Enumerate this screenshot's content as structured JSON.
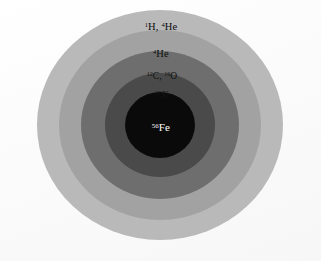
{
  "figure": {
    "background_color": "#fdfdfd",
    "center_x": 160,
    "center_y": 125
  },
  "chart_data": {
    "type": "pie",
    "subtitle": "",
    "xlabel": "",
    "ylabel": "",
    "legend_position": "none",
    "grid": false,
    "note": "Concentric nested shells of a pre-supernova massive star; each ring is labelled with its dominant nuclear species. Radii are in screenshot pixels measured from the common centre.",
    "categories": [
      "1H, 4He",
      "4He",
      "12C, 16O",
      "28Si",
      "56Fe"
    ],
    "values": [
      123,
      101,
      79,
      55,
      35
    ],
    "ylim": [
      0,
      123
    ],
    "shells": [
      {
        "index": 0,
        "label_html": "<sup>1</sup>H, <sup>4</sup>He",
        "label_plain": "1H, 4He",
        "nuclides": [
          "1H",
          "4He"
        ],
        "radius_x": 123,
        "radius_y": 115,
        "color": "#b9b9b9",
        "text_color": "#0d0d0d",
        "font_size_px": 10.5,
        "label_x": 161,
        "label_y": 27
      },
      {
        "index": 1,
        "label_html": "<sup>4</sup>He",
        "label_plain": "4He",
        "nuclides": [
          "4He"
        ],
        "radius_x": 101,
        "radius_y": 95,
        "color": "#a2a2a2",
        "text_color": "#0d0d0d",
        "font_size_px": 10.5,
        "label_x": 161,
        "label_y": 54
      },
      {
        "index": 2,
        "label_html": "<sup>12</sup>C, <sup>16</sup>O",
        "label_plain": "12C, 16O",
        "nuclides": [
          "12C",
          "16O"
        ],
        "radius_x": 79,
        "radius_y": 74,
        "color": "#6e6e6e",
        "text_color": "#111111",
        "font_size_px": 9.5,
        "label_x": 162,
        "label_y": 77
      },
      {
        "index": 3,
        "label_html": "<sup>28</sup>Si",
        "label_plain": "28Si",
        "nuclides": [
          "28Si"
        ],
        "radius_x": 55,
        "radius_y": 52,
        "color": "#4a4a4a",
        "text_color": "#141414",
        "font_size_px": 9.5,
        "label_x": 162,
        "label_y": 96
      },
      {
        "index": 4,
        "label_html": "<sup>56</sup>Fe",
        "label_plain": "56Fe",
        "nuclides": [
          "56Fe"
        ],
        "radius_x": 35,
        "radius_y": 33,
        "color": "#0a0a0a",
        "text_color": "#ffffff",
        "font_size_px": 11,
        "label_x": 161,
        "label_y": 127
      }
    ]
  }
}
